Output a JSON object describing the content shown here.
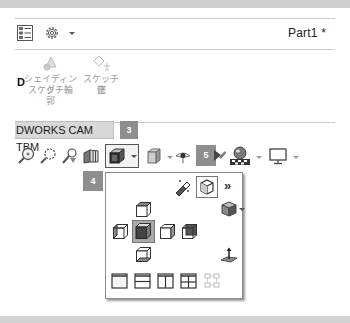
{
  "window": {
    "document_title": "Part1 *"
  },
  "header_icons": [
    {
      "name": "feature-manager-tree-icon"
    },
    {
      "name": "gear-icon"
    },
    {
      "name": "chevron-down-icon"
    }
  ],
  "ribbon": {
    "partial_label": "D",
    "commands": [
      {
        "label_line1": "シェイディング",
        "label_line2": "スケッチ輪",
        "label_line3": "郭",
        "icon": "shaded-sketch-contour-icon",
        "enabled": false
      },
      {
        "label_line1": "スケッチ修",
        "label_line2": "正",
        "icon": "modify-sketch-icon",
        "enabled": false
      }
    ]
  },
  "tabs": [
    {
      "label": "DWORKS CAM TBM",
      "active": true
    }
  ],
  "callouts": {
    "three": "3",
    "four": "4",
    "five": "5"
  },
  "view_toolbar": {
    "items": [
      {
        "icon": "zoom-to-fit-icon"
      },
      {
        "icon": "zoom-to-area-icon"
      },
      {
        "icon": "previous-view-icon"
      },
      {
        "icon": "section-view-icon"
      },
      {
        "icon": "view-orientation-icon",
        "has_dropdown": true,
        "selected": true
      },
      {
        "icon": "display-style-icon",
        "has_dropdown": true
      },
      {
        "icon": "hide-show-items-icon",
        "has_dropdown": true
      },
      {
        "icon": "edit-appearance-icon"
      },
      {
        "icon": "apply-scene-icon",
        "has_dropdown": true
      },
      {
        "icon": "view-settings-icon",
        "has_dropdown": true
      }
    ]
  },
  "orientation_popup": {
    "top_row": [
      {
        "icon": "view-selector-icon"
      },
      {
        "icon": "view-cube-toggle-icon",
        "boxed": true
      },
      {
        "icon": "expand-chevron-icon",
        "glyph": "»"
      }
    ],
    "views": {
      "top": "top-view-icon",
      "isometric_dropdown": "isometric-view-icon",
      "left": "left-view-icon",
      "front": "front-view-icon",
      "right": "right-view-icon",
      "back": "back-view-icon",
      "bottom": "bottom-view-icon",
      "normal_to": "normal-to-icon"
    },
    "viewports": [
      {
        "icon": "single-view-icon"
      },
      {
        "icon": "two-view-horizontal-icon"
      },
      {
        "icon": "two-view-vertical-icon"
      },
      {
        "icon": "four-view-icon"
      },
      {
        "icon": "link-views-icon",
        "enabled": false
      }
    ]
  }
}
